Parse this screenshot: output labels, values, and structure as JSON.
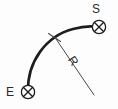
{
  "diagram": {
    "background_color": "#fdfdfd",
    "stroke_color": "#1e1e1e",
    "thin_stroke_color": "#4a4a4a",
    "text_color": "#2b2b2b",
    "labels": {
      "start_point": "E",
      "end_point": "S",
      "radius": "R"
    },
    "markers": [
      {
        "name": "point-e-marker",
        "label": "E",
        "symbol": "circled-x",
        "x": 28,
        "y": 92
      },
      {
        "name": "point-s-marker",
        "label": "S",
        "symbol": "circled-x",
        "x": 99,
        "y": 27
      }
    ],
    "arc": {
      "name": "curve-arc",
      "start_x": 28,
      "start_y": 92,
      "end_x": 97,
      "end_y": 27,
      "radius": 78,
      "stroke_width": 2.6
    },
    "radius_line": {
      "name": "radius-leader-line",
      "from_x": 56,
      "from_y": 38,
      "to_x": 94,
      "to_y": 95,
      "stroke_width": 1,
      "label": "R",
      "label_x": 70,
      "label_y": 62,
      "label_rotation": 56
    },
    "tick": {
      "name": "perpendicular-tick",
      "x1": 48,
      "y1": 33,
      "x2": 61,
      "y2": 42
    }
  }
}
